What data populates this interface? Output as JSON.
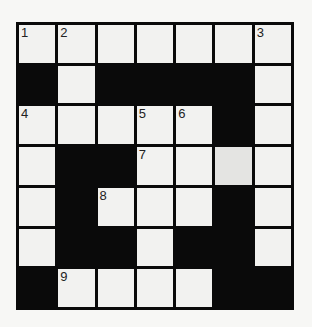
{
  "puzzle": {
    "type": "crossword",
    "rows": 7,
    "cols": 7,
    "colors": {
      "black": "#0a0a0a",
      "white": "#f2f2f0",
      "shaded": "#e4e4e2",
      "background": "#f7f7f5"
    },
    "grid": [
      [
        "W",
        "W",
        "W",
        "W",
        "W",
        "W",
        "W"
      ],
      [
        "B",
        "W",
        "B",
        "B",
        "B",
        "B",
        "W"
      ],
      [
        "W",
        "W",
        "W",
        "W",
        "W",
        "B",
        "W"
      ],
      [
        "W",
        "B",
        "B",
        "W",
        "W",
        "S",
        "W"
      ],
      [
        "W",
        "B",
        "W",
        "W",
        "W",
        "B",
        "W"
      ],
      [
        "W",
        "B",
        "B",
        "W",
        "B",
        "B",
        "W"
      ],
      [
        "B",
        "W",
        "W",
        "W",
        "W",
        "B",
        "B"
      ]
    ],
    "numbers": [
      [
        "1",
        "2",
        "",
        "",
        "",
        "",
        "3"
      ],
      [
        "",
        "",
        "",
        "",
        "",
        "",
        ""
      ],
      [
        "4",
        "",
        "",
        "5",
        "6",
        "",
        ""
      ],
      [
        "",
        "",
        "",
        "7",
        "",
        "",
        ""
      ],
      [
        "",
        "",
        "8",
        "",
        "",
        "",
        ""
      ],
      [
        "",
        "",
        "",
        "",
        "",
        "",
        ""
      ],
      [
        "",
        "9",
        "",
        "",
        "",
        "",
        ""
      ]
    ]
  }
}
